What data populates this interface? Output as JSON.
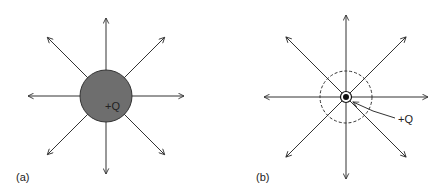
{
  "panels": [
    {
      "id": "a",
      "label": "(a)",
      "charge_label": "+Q",
      "description": "Charged sphere with radial field lines"
    },
    {
      "id": "b",
      "label": "(b)",
      "charge_label": "+Q",
      "description": "Point charge with dashed spherical surface and radial field lines"
    }
  ],
  "colors": {
    "line": "#333333",
    "sphere_fill": "#6e6e6e",
    "charge_dot": "#111111"
  },
  "field_line_directions_deg": [
    0,
    45,
    90,
    135,
    180,
    225,
    270,
    315
  ]
}
